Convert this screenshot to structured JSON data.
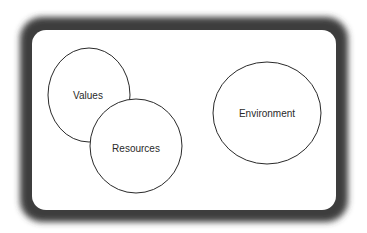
{
  "diagram": {
    "frame": {
      "outer_color": "#4a4a4a",
      "inner_color": "#ffffff"
    },
    "nodes": [
      {
        "id": "values",
        "label": "Values",
        "cx": 89,
        "cy": 95,
        "rx": 41,
        "ry": 47
      },
      {
        "id": "resources",
        "label": "Resources",
        "cx": 136,
        "cy": 146,
        "rx": 46,
        "ry": 47
      },
      {
        "id": "environment",
        "label": "Environment",
        "cx": 267,
        "cy": 113,
        "rx": 54,
        "ry": 51
      }
    ],
    "stroke_color": "#2a2a2a"
  }
}
